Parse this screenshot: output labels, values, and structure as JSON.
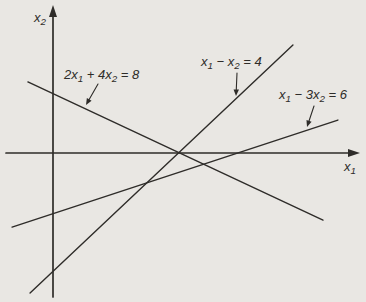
{
  "figure": {
    "kind": "math-graph",
    "background_color": "#e9e7e3",
    "ink_color": "#2e2c29",
    "width": 366,
    "height": 302
  },
  "chart_data": {
    "type": "line",
    "title": "",
    "xlabel": "x1",
    "ylabel": "x2",
    "grid": false,
    "ticks": "none",
    "axes": {
      "x_range": [
        -1.5,
        9.9
      ],
      "y_range": [
        -4.7,
        4.9
      ],
      "x_axis": {
        "label_parts": [
          {
            "t": "x",
            "sub": false
          },
          {
            "t": "1",
            "sub": true
          }
        ],
        "label_px": [
          344,
          171
        ],
        "arrow": "right"
      },
      "y_axis": {
        "label_parts": [
          {
            "t": "x",
            "sub": false
          },
          {
            "t": "2",
            "sub": true
          }
        ],
        "label_px": [
          34,
          22
        ],
        "arrow": "up"
      }
    },
    "series": [
      {
        "name": "line-2x1+4x2=8",
        "equation": "2x1 + 4x2 = 8",
        "coefficients": {
          "a": 2,
          "b": 4,
          "c": 8
        },
        "segment_math": [
          [
            -0.81,
            2.33
          ],
          [
            8.71,
            -2.2
          ]
        ]
      },
      {
        "name": "line-x1-x2=4",
        "equation": "x1 - x2 = 4",
        "coefficients": {
          "a": 1,
          "b": -1,
          "c": 4
        },
        "segment_math": [
          [
            -0.74,
            -4.59
          ],
          [
            7.74,
            3.54
          ]
        ]
      },
      {
        "name": "line-x1-3x2=6",
        "equation": "x1 - 3x2 = 6",
        "coefficients": {
          "a": 1,
          "b": -3,
          "c": 6
        },
        "segment_math": [
          [
            -1.32,
            -2.43
          ],
          [
            9.19,
            1.08
          ]
        ]
      }
    ],
    "annotations": [
      {
        "id": "label-2x1-4x2-8",
        "parts": [
          {
            "t": "2x",
            "sub": false
          },
          {
            "t": "1",
            "sub": true
          },
          {
            "t": " + 4x",
            "sub": false
          },
          {
            "t": "2",
            "sub": true
          },
          {
            "t": " = 8",
            "sub": false
          }
        ],
        "text_px": [
          64,
          79
        ],
        "arrow_from_px": [
          98,
          84
        ],
        "arrow_to_px": [
          86,
          105
        ]
      },
      {
        "id": "label-x1-x2-4",
        "parts": [
          {
            "t": "x",
            "sub": false
          },
          {
            "t": "1",
            "sub": true
          },
          {
            "t": " − x",
            "sub": false
          },
          {
            "t": "2",
            "sub": true
          },
          {
            "t": " = 4",
            "sub": false
          }
        ],
        "text_px": [
          201,
          66
        ],
        "arrow_from_px": [
          237,
          73
        ],
        "arrow_to_px": [
          236,
          96
        ]
      },
      {
        "id": "label-x1-3x2-6",
        "parts": [
          {
            "t": "x",
            "sub": false
          },
          {
            "t": "1",
            "sub": true
          },
          {
            "t": " − 3x",
            "sub": false
          },
          {
            "t": "2",
            "sub": true
          },
          {
            "t": " = 6",
            "sub": false
          }
        ],
        "text_px": [
          279,
          99
        ],
        "arrow_from_px": [
          314,
          106
        ],
        "arrow_to_px": [
          307,
          127
        ]
      }
    ]
  },
  "view": {
    "origin_px": [
      53,
      153
    ],
    "px_per_unit_x": 31,
    "px_per_unit_y": 30.5,
    "x_axis_px": {
      "from": [
        6,
        153
      ],
      "tip": [
        360,
        153
      ]
    },
    "y_axis_px": {
      "from": [
        53,
        297
      ],
      "tip": [
        53,
        5
      ]
    },
    "stroke": {
      "axis": 1.7,
      "line": 1.4,
      "arrow": 1.1
    },
    "font": {
      "label_size": 13,
      "sub_size": 9.8,
      "sub_dy": 3.2
    }
  }
}
